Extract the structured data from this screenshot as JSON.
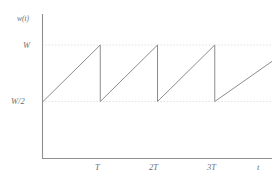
{
  "chart_data": {
    "type": "line",
    "title": "",
    "subtitle": "",
    "xlabel": "t",
    "ylabel": "w(t)",
    "grid": "horizontal-dotted",
    "legend": "none",
    "xlim": [
      0,
      4
    ],
    "ylim": [
      0,
      1.55
    ],
    "x_ticks": [
      {
        "value": 1,
        "label": "T"
      },
      {
        "value": 2,
        "label": "2T"
      },
      {
        "value": 3,
        "label": "3T"
      }
    ],
    "y_ticks": [
      {
        "value": 1.0,
        "label": "W"
      },
      {
        "value": 0.5,
        "label": "W/2"
      }
    ],
    "series": [
      {
        "name": "w(t)",
        "color": "#8c8c8c",
        "points": [
          {
            "x": 0.0,
            "y": 0.5
          },
          {
            "x": 1.0,
            "y": 1.0
          },
          {
            "x": 1.0,
            "y": 0.5
          },
          {
            "x": 2.0,
            "y": 1.0
          },
          {
            "x": 2.0,
            "y": 0.5
          },
          {
            "x": 3.0,
            "y": 1.0
          },
          {
            "x": 3.0,
            "y": 0.5
          },
          {
            "x": 4.0,
            "y": 0.855
          }
        ]
      }
    ],
    "gridlines_y": [
      1.0,
      0.5
    ],
    "axis_color": "#8e8e8e",
    "grid_color": "#d8d8d8",
    "background_color": "#ffffff"
  },
  "labels": {
    "y_axis_function": "w(t)",
    "y_tick_w": "W",
    "y_tick_w_half": "W/2",
    "x_tick_t1": "T",
    "x_tick_t2": "2T",
    "x_tick_t3": "3T",
    "x_axis_title": "t"
  }
}
